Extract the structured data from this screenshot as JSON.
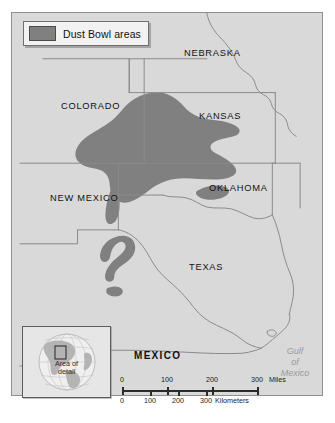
{
  "legend": {
    "swatch_name": "dust-bowl-swatch",
    "label": "Dust Bowl areas",
    "swatch_color": "#808080"
  },
  "map": {
    "background_color": "#d9d9d9",
    "dust_bowl_color": "#808080",
    "border_color": "#8a8a8a",
    "labels": [
      {
        "name": "nebraska",
        "text": "NEBRASKA",
        "x": 183,
        "y": 47,
        "style": "plain"
      },
      {
        "name": "colorado",
        "text": "COLORADO",
        "x": 60,
        "y": 100,
        "style": "plain"
      },
      {
        "name": "kansas",
        "text": "KANSAS",
        "x": 198,
        "y": 110,
        "style": "plain"
      },
      {
        "name": "oklahoma",
        "text": "OKLAHOMA",
        "x": 208,
        "y": 182,
        "style": "plain"
      },
      {
        "name": "new-mexico",
        "text": "NEW MEXICO",
        "x": 49,
        "y": 192,
        "style": "plain"
      },
      {
        "name": "texas",
        "text": "TEXAS",
        "x": 188,
        "y": 261,
        "style": "plain"
      },
      {
        "name": "mexico",
        "text": "MEXICO",
        "x": 133,
        "y": 349,
        "style": "big"
      }
    ],
    "water_labels": [
      {
        "name": "gulf-of-mexico",
        "lines": [
          "Gulf",
          "of",
          "Mexico"
        ],
        "x": 276,
        "y": 341
      }
    ]
  },
  "inset": {
    "title_lines": [
      "Area of",
      "detail"
    ],
    "globe_land_color": "#b4b4b4",
    "globe_ocean_color": "#e9e9e9"
  },
  "scale": {
    "miles": {
      "ticks": [
        "0",
        "100",
        "200",
        "300"
      ],
      "unit": "Miles",
      "positions": [
        0,
        45,
        90,
        135
      ]
    },
    "kilometers": {
      "ticks": [
        "0",
        "100",
        "200",
        "300"
      ],
      "unit": "Kilometers",
      "positions": [
        0,
        28,
        56,
        84
      ]
    }
  }
}
